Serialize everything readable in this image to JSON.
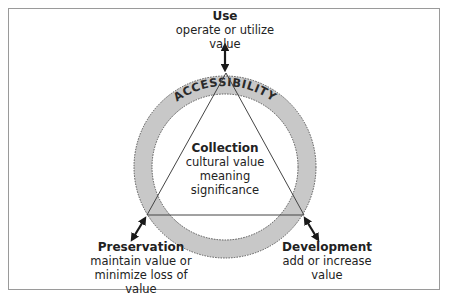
{
  "diagram": {
    "ring_label": "ACCESSIBILITY",
    "center": {
      "title": "Collection",
      "lines": [
        "cultural value",
        "meaning",
        "significance"
      ]
    },
    "nodes": {
      "use": {
        "title": "Use",
        "lines": [
          "operate or utilize",
          "value"
        ]
      },
      "preservation": {
        "title": "Preservation",
        "lines": [
          "maintain value or",
          "minimize loss of",
          "value"
        ]
      },
      "development": {
        "title": "Development",
        "lines": [
          "add or increase",
          "value"
        ]
      }
    },
    "colors": {
      "ring_fill": "#c8c8c8",
      "ring_stroke": "#555555",
      "triangle_stroke": "#444444",
      "arrow": "#1a1a1a",
      "frame": "#9a9a9a"
    }
  }
}
